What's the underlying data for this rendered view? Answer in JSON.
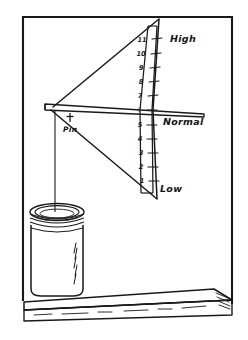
{
  "figure": {
    "frame": {
      "color": "#1a1a1a"
    },
    "background_color": "#ffffff",
    "ink_color": "#1a1a1a"
  },
  "labels": {
    "high": "High",
    "normal": "Normal",
    "low": "Low",
    "pin": "Pin"
  },
  "scale": {
    "marks": [
      {
        "value": "11"
      },
      {
        "value": "10"
      },
      {
        "value": "9"
      },
      {
        "value": "8"
      },
      {
        "value": "7"
      },
      {
        "value": "6"
      },
      {
        "value": "5"
      },
      {
        "value": "4"
      },
      {
        "value": "3"
      },
      {
        "value": "2"
      },
      {
        "value": "1"
      }
    ],
    "top_value": "11",
    "bottom_value": "1",
    "normal_value": "6"
  },
  "parts": {
    "pointer_arm": "pointer-arm",
    "string": "hanging-string",
    "jar": "glass-jar",
    "jar_lid": "jar-lid",
    "shelf": "shelf-board",
    "scale_strip": "scale-strip",
    "pin_marker": "pin-marker",
    "triangle": "indicator-triangle"
  }
}
